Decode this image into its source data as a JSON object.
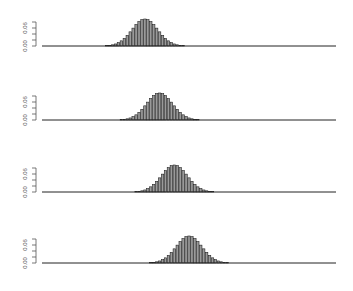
{
  "chart_data": [
    {
      "type": "bar",
      "title": "",
      "xlabel": "",
      "ylabel": "",
      "ylim": [
        0,
        0.09
      ],
      "y_ticks": [
        0.0,
        0.02,
        0.04,
        0.06,
        0.08
      ],
      "y_tick_labels": [
        "0.00",
        "0.06"
      ],
      "x_range": [
        0,
        100
      ],
      "grid": false,
      "distribution": {
        "center": 35,
        "sd": 4.4,
        "peak": 0.09
      }
    },
    {
      "type": "bar",
      "title": "",
      "xlabel": "",
      "ylabel": "",
      "ylim": [
        0,
        0.09
      ],
      "y_ticks": [
        0.0,
        0.02,
        0.04,
        0.06,
        0.08
      ],
      "y_tick_labels": [
        "0.00",
        "0.06"
      ],
      "x_range": [
        0,
        100
      ],
      "grid": false,
      "distribution": {
        "center": 40,
        "sd": 4.4,
        "peak": 0.09
      }
    },
    {
      "type": "bar",
      "title": "",
      "xlabel": "",
      "ylabel": "",
      "ylim": [
        0,
        0.09
      ],
      "y_ticks": [
        0.0,
        0.02,
        0.04,
        0.06,
        0.08
      ],
      "y_tick_labels": [
        "0.00",
        "0.06"
      ],
      "x_range": [
        0,
        100
      ],
      "grid": false,
      "distribution": {
        "center": 45,
        "sd": 4.4,
        "peak": 0.09
      }
    },
    {
      "type": "bar",
      "title": "",
      "xlabel": "",
      "ylabel": "",
      "ylim": [
        0,
        0.09
      ],
      "y_ticks": [
        0.0,
        0.02,
        0.04,
        0.06,
        0.08
      ],
      "y_tick_labels": [
        "0.00",
        "0.06"
      ],
      "x_range": [
        0,
        100
      ],
      "grid": false,
      "distribution": {
        "center": 50,
        "sd": 4.4,
        "peak": 0.09
      }
    }
  ],
  "style": {
    "bar_color": "#222222",
    "bar_fill": "#9a9a9a",
    "axis_color": "#555555",
    "label_color": "#555555"
  }
}
